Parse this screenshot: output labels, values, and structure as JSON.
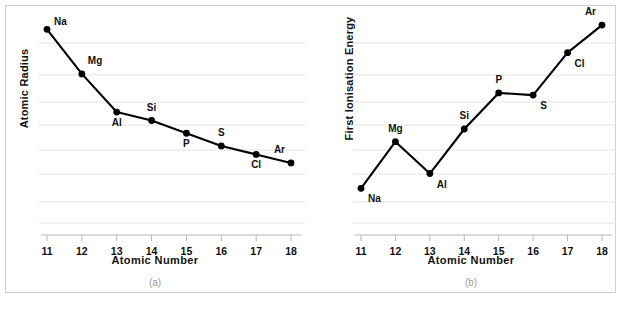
{
  "figure": {
    "panels": [
      {
        "id": "a",
        "caption": "(a)",
        "xlabel": "Atomic  Number",
        "ylabel": "Atomic Radius"
      },
      {
        "id": "b",
        "caption": "(b)",
        "xlabel": "Atomic  Number",
        "ylabel": "First  Ionisation  Energy"
      }
    ],
    "colors": {
      "line": "#000000",
      "marker": "#000000",
      "grid": "#e3e3e3",
      "axis": "#b6b6b6",
      "frame": "#cfcfcf",
      "text": "#111111",
      "caption": "#9a9a9a",
      "background": "#ffffff"
    }
  },
  "chart_data": [
    {
      "type": "line",
      "title": "(a)",
      "xlabel": "Atomic  Number",
      "ylabel": "Atomic Radius",
      "grid": true,
      "legend": "none",
      "xlim": [
        11,
        18
      ],
      "ylim": [
        0,
        100
      ],
      "categories": [
        "11",
        "12",
        "13",
        "14",
        "15",
        "16",
        "17",
        "18"
      ],
      "x": [
        11,
        12,
        13,
        14,
        15,
        16,
        17,
        18
      ],
      "tick_labels_x": [
        "11",
        "12",
        "13",
        "14",
        "15",
        "16",
        "17",
        "18"
      ],
      "tick_labels_y": [],
      "point_labels": [
        "Na",
        "Mg",
        "Al",
        "Si",
        "P",
        "S",
        "Cl",
        "Ar"
      ],
      "values": [
        97,
        76,
        58,
        54,
        48,
        42,
        38,
        34
      ],
      "annotations": [
        {
          "label": "Na",
          "x": 11,
          "position": "right"
        },
        {
          "label": "Mg",
          "x": 12,
          "position": "above-right"
        },
        {
          "label": "Al",
          "x": 13,
          "position": "below"
        },
        {
          "label": "Si",
          "x": 14,
          "position": "above"
        },
        {
          "label": "P",
          "x": 15,
          "position": "below"
        },
        {
          "label": "S",
          "x": 16,
          "position": "above"
        },
        {
          "label": "Cl",
          "x": 17,
          "position": "below"
        },
        {
          "label": "Ar",
          "x": 18,
          "position": "above-left"
        }
      ]
    },
    {
      "type": "line",
      "title": "(b)",
      "xlabel": "Atomic  Number",
      "ylabel": "First  Ionisation  Energy",
      "grid": true,
      "legend": "none",
      "xlim": [
        11,
        18
      ],
      "ylim": [
        0,
        100
      ],
      "categories": [
        "11",
        "12",
        "13",
        "14",
        "15",
        "16",
        "17",
        "18"
      ],
      "x": [
        11,
        12,
        13,
        14,
        15,
        16,
        17,
        18
      ],
      "tick_labels_x": [
        "11",
        "12",
        "13",
        "14",
        "15",
        "16",
        "17",
        "18"
      ],
      "tick_labels_y": [],
      "point_labels": [
        "Na",
        "Mg",
        "Al",
        "Si",
        "P",
        "S",
        "Cl",
        "Ar"
      ],
      "values": [
        22,
        44,
        29,
        50,
        67,
        66,
        86,
        99
      ],
      "annotations": [
        {
          "label": "Na",
          "x": 11,
          "position": "below-right"
        },
        {
          "label": "Mg",
          "x": 12,
          "position": "above"
        },
        {
          "label": "Al",
          "x": 13,
          "position": "below-right"
        },
        {
          "label": "Si",
          "x": 14,
          "position": "above"
        },
        {
          "label": "P",
          "x": 15,
          "position": "above"
        },
        {
          "label": "S",
          "x": 16,
          "position": "below-right"
        },
        {
          "label": "Cl",
          "x": 17,
          "position": "below-right"
        },
        {
          "label": "Ar",
          "x": 18,
          "position": "above-left"
        }
      ]
    }
  ]
}
